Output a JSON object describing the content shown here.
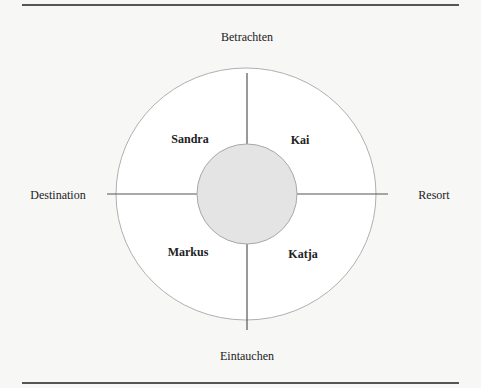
{
  "diagram": {
    "axes": {
      "top": "Betrachten",
      "bottom": "Eintauchen",
      "left": "Destination",
      "right": "Resort"
    },
    "quadrants": {
      "top_left": "Sandra",
      "top_right": "Kai",
      "bottom_left": "Markus",
      "bottom_right": "Katja"
    },
    "colors": {
      "background": "#f7f7f6",
      "outer_circle_fill": "#ffffff",
      "outer_circle_stroke": "#b0b0b0",
      "inner_circle_fill": "#e4e4e4",
      "inner_circle_stroke": "#a8a8a8",
      "axis_line": "#555555",
      "rule": "#555555"
    }
  }
}
